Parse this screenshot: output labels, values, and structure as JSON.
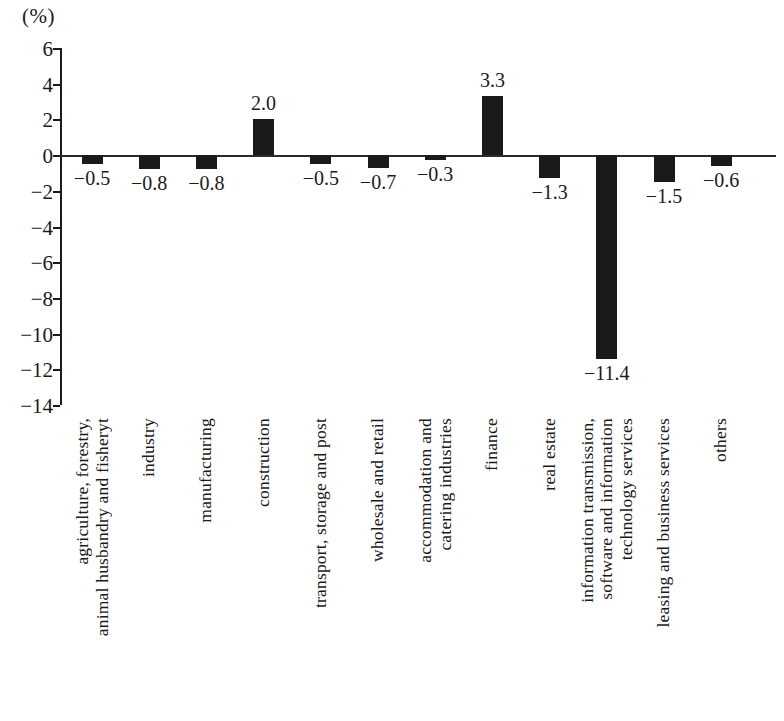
{
  "chart_data": {
    "type": "bar",
    "title": "",
    "subtitle": "",
    "unit_label": "(%)",
    "xlabel": "",
    "ylabel": "",
    "ylim": [
      -14,
      6
    ],
    "grid": false,
    "legend": false,
    "y_ticks": [
      6,
      4,
      2,
      0,
      -2,
      -4,
      -6,
      -8,
      -10,
      -12,
      -14
    ],
    "y_tick_labels": [
      "6",
      "4",
      "2",
      "0",
      "−2",
      "−4",
      "−6",
      "−8",
      "−10",
      "−12",
      "−14"
    ],
    "categories": [
      "agriculture, forestry, animal husbandry and fisheryt",
      "industry",
      "manufacturing",
      "construction",
      "transport, storage and post",
      "wholesale and retail",
      "accommodation and catering industries",
      "finance",
      "real estate",
      "information transmission, software and information technology services",
      "leasing and business services",
      "others"
    ],
    "category_lines": [
      [
        "agriculture, forestry,",
        "animal husbandry and fisheryt"
      ],
      [
        "industry"
      ],
      [
        "manufacturing"
      ],
      [
        "construction"
      ],
      [
        "transport, storage and post"
      ],
      [
        "wholesale and retail"
      ],
      [
        "accommodation and",
        "catering industries"
      ],
      [
        "finance"
      ],
      [
        "real estate"
      ],
      [
        "information transmission,",
        "software and information",
        "technology services"
      ],
      [
        "leasing and business services"
      ],
      [
        "others"
      ]
    ],
    "values": [
      -0.5,
      -0.8,
      -0.8,
      2.0,
      -0.5,
      -0.7,
      -0.3,
      3.3,
      -1.3,
      -11.4,
      -1.5,
      -0.6
    ],
    "value_labels": [
      "−0.5",
      "−0.8",
      "−0.8",
      "2.0",
      "−0.5",
      "−0.7",
      "−0.3",
      "3.3",
      "−1.3",
      "−11.4",
      "−1.5",
      "−0.6"
    ],
    "bar_color": "#1a1a1a",
    "axis_color": "#1a1a1a",
    "background_color": "#ffffff"
  }
}
